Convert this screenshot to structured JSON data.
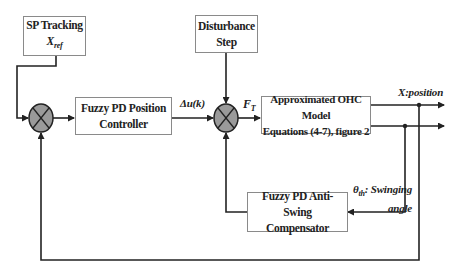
{
  "diagram": {
    "type": "control-block-diagram",
    "blocks": {
      "sp_tracking": {
        "line1": "SP Tracking",
        "line2": "X",
        "line2_sub": "ref"
      },
      "disturbance": {
        "line1": "Disturbance",
        "line2": "Step"
      },
      "position_controller": {
        "line1": "Fuzzy PD Position",
        "line2": "Controller"
      },
      "ohc_model": {
        "line1": "Approximated OHC Model",
        "line2": "Equations (4-7), figure 2"
      },
      "anti_swing": {
        "line1": "Fuzzy PD Anti-Swing",
        "line2": "Compensator"
      }
    },
    "signals": {
      "delta_u": "Δu(k)",
      "force": "F",
      "force_sub": "T",
      "position": "X:position",
      "theta": "θ",
      "theta_sub": "th",
      "swing_line1": ": Swinging",
      "swing_line2": "angle"
    },
    "summing_junctions": [
      {
        "id": "position-error-sum",
        "fill": "#9a9a9a"
      },
      {
        "id": "force-sum",
        "fill": "#9a9a9a"
      }
    ],
    "colors": {
      "line": "#222222",
      "block_border": "#8a8a8a",
      "junction_fill": "#9a9a9a"
    }
  }
}
